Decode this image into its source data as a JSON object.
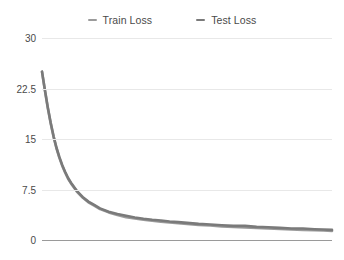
{
  "legend": {
    "position": "top-center",
    "items": [
      {
        "label": "Train Loss",
        "color": "#9b9b9b",
        "marker": "dash"
      },
      {
        "label": "Test Loss",
        "color": "#7a7a7a",
        "marker": "dash"
      }
    ]
  },
  "axes": {
    "y_tick_labels": [
      "30",
      "22.5",
      "15",
      "7.5",
      "0"
    ],
    "x_tick_labels": []
  },
  "chart_data": {
    "type": "line",
    "title": "",
    "subtitle": "",
    "xlabel": "",
    "ylabel": "",
    "xlim": [
      0,
      100
    ],
    "ylim": [
      0,
      30
    ],
    "grid": true,
    "legend_position": "top-center",
    "yticks": [
      0,
      7.5,
      15,
      22.5,
      30
    ],
    "xticks": [],
    "x": [
      0,
      1,
      2,
      3,
      4,
      5,
      6,
      7,
      8,
      9,
      10,
      12,
      14,
      16,
      18,
      20,
      23,
      26,
      29,
      32,
      35,
      38,
      41,
      44,
      47,
      50,
      54,
      58,
      62,
      66,
      70,
      74,
      78,
      82,
      86,
      90,
      94,
      97,
      100
    ],
    "series": [
      {
        "name": "Train Loss",
        "color": "#9b9b9b",
        "values": [
          25.0,
          22.2,
          19.6,
          17.3,
          15.3,
          13.6,
          12.2,
          11.0,
          10.0,
          9.1,
          8.4,
          7.2,
          6.3,
          5.6,
          5.1,
          4.6,
          4.1,
          3.7,
          3.4,
          3.2,
          3.0,
          2.85,
          2.7,
          2.6,
          2.5,
          2.4,
          2.25,
          2.15,
          2.0,
          1.95,
          1.85,
          1.8,
          1.7,
          1.65,
          1.55,
          1.5,
          1.45,
          1.4,
          1.35
        ]
      },
      {
        "name": "Test Loss",
        "color": "#7a7a7a",
        "values": [
          25.0,
          22.3,
          19.7,
          17.4,
          15.4,
          13.7,
          12.3,
          11.1,
          10.1,
          9.2,
          8.5,
          7.3,
          6.4,
          5.7,
          5.2,
          4.7,
          4.2,
          3.85,
          3.6,
          3.35,
          3.15,
          3.0,
          2.9,
          2.75,
          2.65,
          2.55,
          2.4,
          2.3,
          2.2,
          2.1,
          2.1,
          1.95,
          1.9,
          1.8,
          1.7,
          1.7,
          1.6,
          1.55,
          1.5
        ]
      }
    ]
  },
  "colors": {
    "gridline": "#e8e8e8",
    "baseline": "#9a9a9a",
    "text": "#4a4a4a",
    "background": "#ffffff"
  }
}
